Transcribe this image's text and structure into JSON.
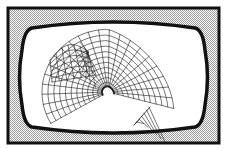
{
  "figure": {
    "colors": {
      "background": "#ffffff",
      "frame_stroke": "#111111",
      "dither_light": "#ffffff",
      "dither_dark": "#9a9a9a",
      "screen_fill": "#ffffff",
      "wire": "#1a1a1a"
    },
    "frame": {
      "x": 8,
      "y": 8,
      "width": 211,
      "height": 135,
      "stroke_width": 3
    },
    "screen": {
      "left": 22,
      "right": 205,
      "top": 20,
      "bottom": 135,
      "corner_bulge": 7,
      "stroke_width": 3.5
    },
    "wireframe": {
      "center": [
        108,
        92
      ],
      "main_lobe": {
        "r_min": 6,
        "r_max": 66,
        "angle_start": 150,
        "angle_end": 355,
        "rings": 11,
        "spokes": 22
      },
      "left_lobe": {
        "anchor": [
          86,
          50
        ],
        "tip": [
          50,
          60
        ],
        "bottom": [
          52,
          82
        ],
        "rows": 6,
        "cols": 6
      },
      "drape": {
        "start": [
          150,
          95
        ],
        "end": [
          142,
          125
        ],
        "cols": 6
      }
    }
  }
}
